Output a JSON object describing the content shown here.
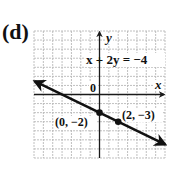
{
  "part_label": "(d)",
  "colors": {
    "grid": "#b9b9b9",
    "axis": "#1a1a1a",
    "line": "#111111",
    "text": "#111111",
    "background": "#ffffff"
  },
  "chart_data": {
    "type": "line",
    "title": "x + 2y = −4",
    "equation": "x + 2y = −4",
    "xlabel": "x",
    "ylabel": "y",
    "origin_label": "0",
    "xlim": [
      -7,
      7
    ],
    "ylim": [
      -7,
      7
    ],
    "grid": true,
    "grid_step": 1,
    "axis_arrows": {
      "x_positive": true,
      "y_positive": true
    },
    "line": {
      "slope": -0.5,
      "intercept": -2,
      "arrows_both_ends": true,
      "x_range": [
        -6.9,
        7
      ]
    },
    "points": [
      {
        "x": 0,
        "y": -2,
        "label": "(0, −2)"
      },
      {
        "x": 2,
        "y": -3,
        "label": "(2, −3)"
      }
    ],
    "legend": null
  }
}
